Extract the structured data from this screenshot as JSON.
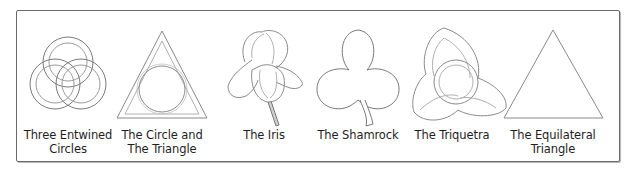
{
  "figure": {
    "symbols": [
      {
        "id": "three-entwined-circles",
        "line1": "Three Entwined",
        "line2": "Circles",
        "cx": 68
      },
      {
        "id": "circle-and-triangle",
        "line1": "The Circle and",
        "line2": "The Triangle",
        "cx": 162
      },
      {
        "id": "iris",
        "line1": "The Iris",
        "line2": "",
        "cx": 264
      },
      {
        "id": "shamrock",
        "line1": "The Shamrock",
        "line2": "",
        "cx": 358
      },
      {
        "id": "triquetra",
        "line1": "The Triquetra",
        "line2": "",
        "cx": 452
      },
      {
        "id": "equilateral-triangle",
        "line1": "The Equilateral",
        "line2": "Triangle",
        "cx": 553
      }
    ],
    "colors": {
      "stroke": "#7a7a7a",
      "stroke_light": "#a8a8a8",
      "frame": "#6a6a6a",
      "text": "#1e1e1e"
    }
  }
}
